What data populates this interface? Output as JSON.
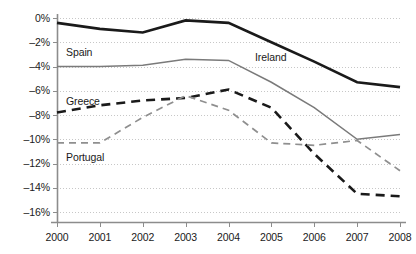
{
  "chart_data": {
    "type": "line",
    "title": "",
    "subtitle": "",
    "xlabel": "",
    "ylabel": "",
    "x": [
      "2000",
      "2001",
      "2002",
      "2003",
      "2004",
      "2005",
      "2006",
      "2007",
      "2008"
    ],
    "categories": [
      "2000",
      "2001",
      "2002",
      "2003",
      "2004",
      "2005",
      "2006",
      "2007",
      "2008"
    ],
    "ylim": [
      -16,
      0
    ],
    "ytick_values": [
      0,
      -2,
      -4,
      -6,
      -8,
      -10,
      -12,
      -14,
      -16
    ],
    "ytick_labels": [
      "0%",
      "–2%",
      "–4%",
      "–6%",
      "–8%",
      "–10%",
      "–12%",
      "–14%",
      "–16%"
    ],
    "grid": true,
    "grid_style": "dotted-horizontal",
    "legend": "inline-labels",
    "series": [
      {
        "name": "Ireland",
        "label": "Ireland",
        "color": "#1a1a1a",
        "style": "solid",
        "width": 2.6,
        "values": [
          -0.4,
          -0.9,
          -1.2,
          -0.2,
          -0.4,
          -2.0,
          -3.6,
          -5.3,
          -5.7
        ],
        "label_x": 255,
        "label_y": 52
      },
      {
        "name": "Spain",
        "label": "Spain",
        "color": "#7a7a7a",
        "style": "solid",
        "width": 1.5,
        "values": [
          -4.0,
          -4.0,
          -3.9,
          -3.4,
          -3.5,
          -5.3,
          -7.4,
          -10.0,
          -9.6
        ],
        "label_x": 66,
        "label_y": 47
      },
      {
        "name": "Greece",
        "label": "Greece",
        "color": "#1a1a1a",
        "style": "dashed",
        "width": 2.6,
        "dasharray": "9,6",
        "values": [
          -7.8,
          -7.2,
          -6.8,
          -6.6,
          -5.9,
          -7.4,
          -11.2,
          -14.5,
          -14.7
        ],
        "label_x": 66,
        "label_y": 96
      },
      {
        "name": "Portugal",
        "label": "Portugal",
        "color": "#8f8f8f",
        "style": "dashed",
        "width": 1.7,
        "dasharray": "7,5",
        "values": [
          -10.3,
          -10.3,
          -8.2,
          -6.4,
          -7.6,
          -10.3,
          -10.5,
          -10.1,
          -12.6
        ],
        "label_x": 66,
        "label_y": 152
      }
    ],
    "axis_color": "#8c8c8c",
    "grid_color": "#b9b9b9",
    "background": "#ffffff",
    "plot": {
      "left": 57,
      "right": 400,
      "top": 18,
      "bottom": 212
    }
  }
}
